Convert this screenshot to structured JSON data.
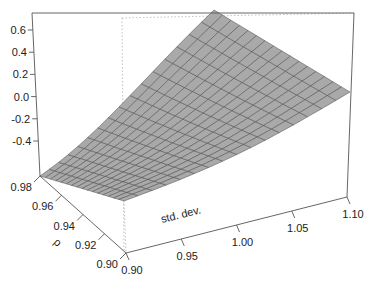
{
  "chart_data": {
    "type": "surface3d",
    "title": "",
    "xlabel": "std. dev.",
    "ylabel": "ρ",
    "zlabel": "",
    "x_ticks": [
      "0.90",
      "0.95",
      "1.00",
      "1.05",
      "1.10"
    ],
    "y_ticks": [
      "0.90",
      "0.92",
      "0.94",
      "0.96",
      "0.98"
    ],
    "z_ticks": [
      "-0.4",
      "-0.2",
      "0.0",
      "0.2",
      "0.4",
      "0.6"
    ],
    "xlim": [
      0.9,
      1.1
    ],
    "ylim": [
      0.9,
      0.98
    ],
    "zlim": [
      -0.5,
      0.65
    ],
    "grid_size": [
      16,
      16
    ],
    "surface_corners": [
      {
        "std_dev": 0.9,
        "rho": 0.98,
        "z": -0.47
      },
      {
        "std_dev": 0.9,
        "rho": 0.9,
        "z": -0.45
      },
      {
        "std_dev": 1.1,
        "rho": 0.9,
        "z": 0.15
      },
      {
        "std_dev": 1.1,
        "rho": 0.98,
        "z": 0.65
      }
    ],
    "surface_color": "#a9a9a9",
    "mesh_color": "#4a4a4a"
  }
}
